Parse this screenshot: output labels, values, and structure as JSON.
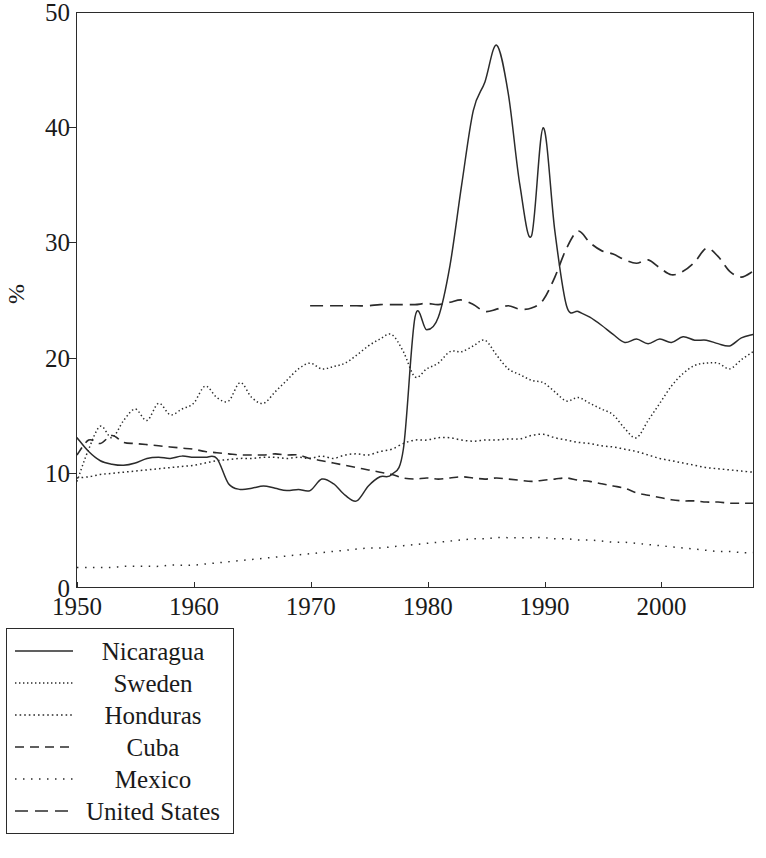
{
  "chart_data": {
    "type": "line",
    "title": "",
    "xlabel": "",
    "ylabel": "%",
    "xlim": [
      1950,
      2008
    ],
    "ylim": [
      0,
      50
    ],
    "grid": false,
    "legend_position": "below-left",
    "xticks": [
      1950,
      1960,
      1970,
      1980,
      1990,
      2000
    ],
    "yticks": [
      0,
      10,
      20,
      30,
      40,
      50
    ],
    "series": [
      {
        "name": "Nicaragua",
        "style": "solid",
        "x": [
          1950,
          1951,
          1952,
          1953,
          1954,
          1955,
          1956,
          1957,
          1958,
          1959,
          1960,
          1961,
          1962,
          1963,
          1964,
          1965,
          1966,
          1967,
          1968,
          1969,
          1970,
          1971,
          1972,
          1973,
          1974,
          1975,
          1976,
          1977,
          1978,
          1979,
          1980,
          1981,
          1982,
          1983,
          1984,
          1985,
          1986,
          1987,
          1988,
          1989,
          1990,
          1991,
          1992,
          1993,
          1994,
          1995,
          1996,
          1997,
          1998,
          1999,
          2000,
          2001,
          2002,
          2003,
          2004,
          2005,
          2006,
          2007,
          2008
        ],
        "values": [
          13.0,
          11.8,
          11.0,
          10.7,
          10.6,
          10.8,
          11.2,
          11.3,
          11.2,
          11.4,
          11.3,
          11.3,
          11.2,
          9.0,
          8.5,
          8.6,
          8.8,
          8.6,
          8.4,
          8.5,
          8.4,
          9.4,
          9.0,
          8.0,
          7.5,
          8.8,
          9.6,
          9.8,
          12.0,
          23.5,
          22.4,
          23.5,
          28.0,
          35.0,
          41.5,
          44.0,
          47.2,
          43.0,
          35.0,
          30.6,
          40.0,
          31.0,
          24.5,
          24.0,
          23.5,
          22.8,
          22.0,
          21.3,
          21.6,
          21.2,
          21.6,
          21.3,
          21.8,
          21.5,
          21.5,
          21.2,
          21.0,
          21.7,
          22.0
        ]
      },
      {
        "name": "Sweden",
        "style": "fine-dotted",
        "x": [
          1950,
          1951,
          1952,
          1953,
          1954,
          1955,
          1956,
          1957,
          1958,
          1959,
          1960,
          1961,
          1962,
          1963,
          1964,
          1965,
          1966,
          1967,
          1968,
          1969,
          1970,
          1971,
          1972,
          1973,
          1974,
          1975,
          1976,
          1977,
          1978,
          1979,
          1980,
          1981,
          1982,
          1983,
          1984,
          1985,
          1986,
          1987,
          1988,
          1989,
          1990,
          1991,
          1992,
          1993,
          1994,
          1995,
          1996,
          1997,
          1998,
          1999,
          2000,
          2001,
          2002,
          2003,
          2004,
          2005,
          2006,
          2007,
          2008
        ],
        "values": [
          9.2,
          12.0,
          14.0,
          13.0,
          14.5,
          15.5,
          14.5,
          16.0,
          15.0,
          15.5,
          16.0,
          17.5,
          16.5,
          16.2,
          17.8,
          16.5,
          16.0,
          17.0,
          18.0,
          19.0,
          19.5,
          19.0,
          19.2,
          19.5,
          20.2,
          21.0,
          21.6,
          22.0,
          20.5,
          18.3,
          19.0,
          19.5,
          20.5,
          20.5,
          21.0,
          21.5,
          20.2,
          19.0,
          18.5,
          18.0,
          17.8,
          17.0,
          16.2,
          16.5,
          16.0,
          15.5,
          15.0,
          13.8,
          13.0,
          14.5,
          16.0,
          17.5,
          18.6,
          19.3,
          19.5,
          19.5,
          19.0,
          19.8,
          20.5
        ]
      },
      {
        "name": "Honduras",
        "style": "dotted",
        "x": [
          1950,
          1951,
          1952,
          1953,
          1954,
          1955,
          1956,
          1957,
          1958,
          1959,
          1960,
          1961,
          1962,
          1963,
          1964,
          1965,
          1966,
          1967,
          1968,
          1969,
          1970,
          1971,
          1972,
          1973,
          1974,
          1975,
          1976,
          1977,
          1978,
          1979,
          1980,
          1981,
          1982,
          1983,
          1984,
          1985,
          1986,
          1987,
          1988,
          1989,
          1990,
          1991,
          1992,
          1993,
          1994,
          1995,
          1996,
          1997,
          1998,
          1999,
          2000,
          2001,
          2002,
          2003,
          2004,
          2005,
          2006,
          2007,
          2008
        ],
        "values": [
          9.5,
          9.6,
          9.8,
          9.9,
          10.0,
          10.1,
          10.2,
          10.3,
          10.4,
          10.5,
          10.6,
          10.8,
          11.0,
          11.1,
          11.2,
          11.2,
          11.3,
          11.3,
          11.2,
          11.3,
          11.2,
          11.4,
          11.2,
          11.5,
          11.6,
          11.5,
          11.8,
          12.0,
          12.5,
          12.8,
          12.8,
          13.0,
          13.0,
          12.8,
          12.7,
          12.8,
          12.8,
          12.9,
          12.9,
          13.2,
          13.3,
          13.0,
          12.8,
          12.6,
          12.5,
          12.3,
          12.2,
          12.0,
          11.8,
          11.5,
          11.2,
          11.0,
          10.8,
          10.6,
          10.4,
          10.3,
          10.2,
          10.1,
          10.0
        ]
      },
      {
        "name": "Cuba",
        "style": "dashed",
        "x": [
          1950,
          1951,
          1952,
          1953,
          1954,
          1955,
          1956,
          1957,
          1958,
          1959,
          1960,
          1961,
          1962,
          1963,
          1964,
          1965,
          1966,
          1967,
          1968,
          1969,
          1970,
          1971,
          1972,
          1973,
          1974,
          1975,
          1976,
          1977,
          1978,
          1979,
          1980,
          1981,
          1982,
          1983,
          1984,
          1985,
          1986,
          1987,
          1988,
          1989,
          1990,
          1991,
          1992,
          1993,
          1994,
          1995,
          1996,
          1997,
          1998,
          1999,
          2000,
          2001,
          2002,
          2003,
          2004,
          2005,
          2006,
          2007,
          2008
        ],
        "values": [
          11.5,
          12.8,
          12.5,
          13.2,
          12.6,
          12.5,
          12.4,
          12.3,
          12.2,
          12.1,
          12.0,
          11.8,
          11.7,
          11.6,
          11.5,
          11.5,
          11.5,
          11.6,
          11.5,
          11.5,
          11.2,
          11.0,
          10.8,
          10.6,
          10.4,
          10.2,
          10.0,
          9.8,
          9.5,
          9.4,
          9.5,
          9.4,
          9.5,
          9.6,
          9.5,
          9.4,
          9.5,
          9.4,
          9.3,
          9.2,
          9.3,
          9.4,
          9.5,
          9.3,
          9.2,
          9.0,
          8.8,
          8.6,
          8.2,
          8.0,
          7.8,
          7.6,
          7.5,
          7.5,
          7.4,
          7.4,
          7.3,
          7.3,
          7.3
        ]
      },
      {
        "name": "Mexico",
        "style": "sparse-dotted",
        "x": [
          1950,
          1951,
          1952,
          1953,
          1954,
          1955,
          1956,
          1957,
          1958,
          1959,
          1960,
          1961,
          1962,
          1963,
          1964,
          1965,
          1966,
          1967,
          1968,
          1969,
          1970,
          1971,
          1972,
          1973,
          1974,
          1975,
          1976,
          1977,
          1978,
          1979,
          1980,
          1981,
          1982,
          1983,
          1984,
          1985,
          1986,
          1987,
          1988,
          1989,
          1990,
          1991,
          1992,
          1993,
          1994,
          1995,
          1996,
          1997,
          1998,
          1999,
          2000,
          2001,
          2002,
          2003,
          2004,
          2005,
          2006,
          2007,
          2008
        ],
        "values": [
          1.7,
          1.7,
          1.7,
          1.7,
          1.8,
          1.8,
          1.8,
          1.8,
          1.9,
          1.9,
          1.9,
          2.0,
          2.1,
          2.2,
          2.3,
          2.4,
          2.5,
          2.6,
          2.7,
          2.8,
          2.9,
          3.0,
          3.1,
          3.2,
          3.3,
          3.4,
          3.4,
          3.5,
          3.6,
          3.7,
          3.8,
          3.9,
          4.0,
          4.1,
          4.2,
          4.2,
          4.3,
          4.3,
          4.3,
          4.3,
          4.3,
          4.2,
          4.2,
          4.1,
          4.1,
          4.0,
          3.9,
          3.9,
          3.8,
          3.7,
          3.6,
          3.5,
          3.4,
          3.3,
          3.2,
          3.1,
          3.1,
          3.0,
          3.0
        ]
      },
      {
        "name": "United States",
        "style": "long-dashed",
        "x": [
          1970,
          1971,
          1972,
          1973,
          1974,
          1975,
          1976,
          1977,
          1978,
          1979,
          1980,
          1981,
          1982,
          1983,
          1984,
          1985,
          1986,
          1987,
          1988,
          1989,
          1990,
          1991,
          1992,
          1993,
          1994,
          1995,
          1996,
          1997,
          1998,
          1999,
          2000,
          2001,
          2002,
          2003,
          2004,
          2005,
          2006,
          2007,
          2008
        ],
        "values": [
          24.5,
          24.5,
          24.5,
          24.5,
          24.5,
          24.5,
          24.6,
          24.6,
          24.6,
          24.6,
          24.7,
          24.6,
          24.8,
          25.0,
          24.6,
          24.0,
          24.2,
          24.5,
          24.2,
          24.3,
          25.0,
          27.0,
          29.5,
          31.0,
          30.0,
          29.3,
          29.0,
          28.5,
          28.2,
          28.5,
          27.8,
          27.2,
          27.5,
          28.3,
          29.5,
          28.8,
          27.5,
          27.0,
          27.5
        ]
      }
    ]
  },
  "axes": {
    "ylabel": "%",
    "yticks": [
      "0",
      "10",
      "20",
      "30",
      "40",
      "50"
    ],
    "xticks": [
      "1950",
      "1960",
      "1970",
      "1980",
      "1990",
      "2000"
    ]
  },
  "legend": {
    "items": [
      {
        "label": "Nicaragua",
        "style": "solid",
        "sample_name": "legend-sample-nicaragua"
      },
      {
        "label": "Sweden",
        "style": "fine-dotted",
        "sample_name": "legend-sample-sweden"
      },
      {
        "label": "Honduras",
        "style": "dotted",
        "sample_name": "legend-sample-honduras"
      },
      {
        "label": "Cuba",
        "style": "dashed",
        "sample_name": "legend-sample-cuba"
      },
      {
        "label": "Mexico",
        "style": "sparse-dotted",
        "sample_name": "legend-sample-mexico"
      },
      {
        "label": "United States",
        "style": "long-dashed",
        "sample_name": "legend-sample-united-states"
      }
    ]
  },
  "colors": {
    "line": "#2b2b2b",
    "axis": "#2b2b2b",
    "background": "#ffffff",
    "text": "#1a1a1a"
  }
}
